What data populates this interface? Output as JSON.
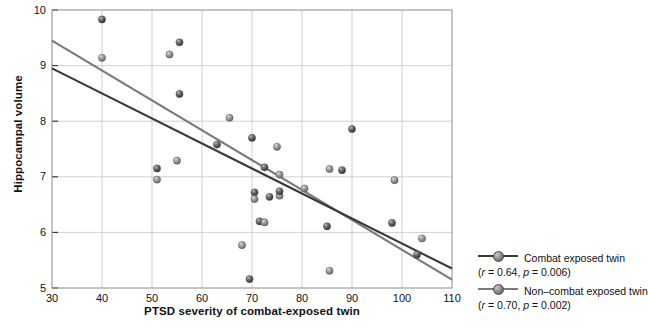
{
  "chart_data": {
    "type": "scatter",
    "title": "",
    "xlabel": "PTSD severity of combat-exposed twin",
    "ylabel": "Hippocampal volume",
    "xlim": [
      30,
      110
    ],
    "ylim": [
      5,
      10
    ],
    "xticks": [
      30,
      40,
      50,
      60,
      70,
      80,
      90,
      100,
      110
    ],
    "yticks": [
      5,
      6,
      7,
      8,
      9,
      10
    ],
    "grid": true,
    "legend_position": "right",
    "series": [
      {
        "name": "Combat exposed twin",
        "stat": "(r = 0.64, p = 0.006)",
        "r": 0.64,
        "p": 0.006,
        "color": "#3a3a3a",
        "marker": "circle",
        "fit_line": {
          "x": [
            30,
            110
          ],
          "y": [
            8.95,
            5.35
          ]
        }
      },
      {
        "name": "Non–combat exposed twin",
        "stat": "(r = 0.70, p = 0.002)",
        "r": 0.7,
        "p": 0.002,
        "color": "#7a7a7a",
        "marker": "circle",
        "fit_line": {
          "x": [
            30,
            110
          ],
          "y": [
            9.45,
            5.15
          ]
        }
      }
    ],
    "points": [
      {
        "x": 40.0,
        "y": 9.83
      },
      {
        "x": 40.0,
        "y": 9.14
      },
      {
        "x": 55.5,
        "y": 9.42
      },
      {
        "x": 53.5,
        "y": 9.2
      },
      {
        "x": 55.5,
        "y": 8.49
      },
      {
        "x": 65.5,
        "y": 8.06
      },
      {
        "x": 63.0,
        "y": 7.58
      },
      {
        "x": 55.0,
        "y": 7.29
      },
      {
        "x": 51.0,
        "y": 7.15
      },
      {
        "x": 51.0,
        "y": 6.95
      },
      {
        "x": 70.0,
        "y": 7.7
      },
      {
        "x": 75.0,
        "y": 7.54
      },
      {
        "x": 72.5,
        "y": 7.17
      },
      {
        "x": 75.5,
        "y": 7.04
      },
      {
        "x": 90.0,
        "y": 7.86
      },
      {
        "x": 85.5,
        "y": 7.14
      },
      {
        "x": 88.0,
        "y": 7.12
      },
      {
        "x": 98.5,
        "y": 6.94
      },
      {
        "x": 70.5,
        "y": 6.72
      },
      {
        "x": 70.5,
        "y": 6.6
      },
      {
        "x": 73.5,
        "y": 6.64
      },
      {
        "x": 75.5,
        "y": 6.66
      },
      {
        "x": 75.5,
        "y": 6.74
      },
      {
        "x": 80.5,
        "y": 6.79
      },
      {
        "x": 71.5,
        "y": 6.2
      },
      {
        "x": 72.5,
        "y": 6.18
      },
      {
        "x": 85.0,
        "y": 6.11
      },
      {
        "x": 68.0,
        "y": 5.77
      },
      {
        "x": 98.0,
        "y": 6.17
      },
      {
        "x": 104.0,
        "y": 5.89
      },
      {
        "x": 103.0,
        "y": 5.6
      },
      {
        "x": 85.5,
        "y": 5.31
      },
      {
        "x": 69.5,
        "y": 5.16
      }
    ]
  },
  "axis": {
    "xticks": [
      "30",
      "40",
      "50",
      "60",
      "70",
      "80",
      "90",
      "100",
      "110"
    ],
    "yticks": [
      "10",
      "9",
      "8",
      "7",
      "6",
      "5"
    ],
    "xlabel": "PTSD severity of combat-exposed twin",
    "ylabel": "Hippocampal volume"
  },
  "legend": {
    "entries": [
      {
        "label": "Combat exposed twin",
        "stat": "(r = 0.64, p = 0.006)"
      },
      {
        "label": "Non–combat exposed twin",
        "stat": "(r = 0.70, p = 0.002)"
      }
    ]
  }
}
